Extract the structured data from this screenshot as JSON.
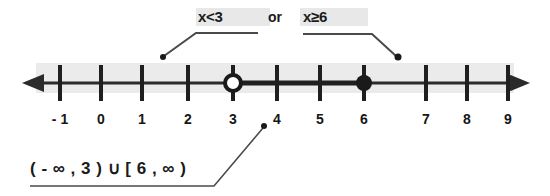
{
  "diagram": {
    "type": "number-line",
    "title_labels": {
      "left_inequality": "x<3",
      "conjunction": "or",
      "right_inequality": "x≥6"
    },
    "interval_notation": "( - ∞ , 3 ) ∪ [ 6 , ∞ )",
    "axis": {
      "tick_labels": [
        "- 1",
        "0",
        "1",
        "2",
        "3",
        "4",
        "5",
        "6",
        "7",
        "8",
        "9"
      ],
      "tick_values": [
        -1,
        0,
        1,
        2,
        3,
        4,
        5,
        6,
        7,
        8,
        9
      ],
      "min_shown": -1,
      "max_shown": 9,
      "left_arrow": "arrow-left",
      "right_arrow": "arrow-right"
    },
    "points": [
      {
        "name": "open-circle-at-3",
        "value": 3,
        "style": "open",
        "meaning": "x<3 excluded endpoint"
      },
      {
        "name": "closed-circle-at-6",
        "value": 6,
        "style": "filled",
        "meaning": "x≥6 included endpoint"
      }
    ],
    "shaded_rays": [
      {
        "name": "ray-left-of-3",
        "from": "-infinity",
        "to": 3,
        "endpoint": "open"
      },
      {
        "name": "ray-right-of-6",
        "from": 6,
        "to": "infinity",
        "endpoint": "closed"
      }
    ],
    "leader_lines": [
      {
        "name": "leader-left-inequality",
        "points_to": 1.6
      },
      {
        "name": "leader-right-inequality",
        "points_to": 6.5
      },
      {
        "name": "leader-interval-notation",
        "points_to": 3.7
      }
    ],
    "colors": {
      "ink": "#1a1a1a",
      "line": "#2b2b2b",
      "band": "#ebebeb",
      "leader": "#555555",
      "highlight": "#e3e3e3",
      "background": "#ffffff"
    }
  }
}
